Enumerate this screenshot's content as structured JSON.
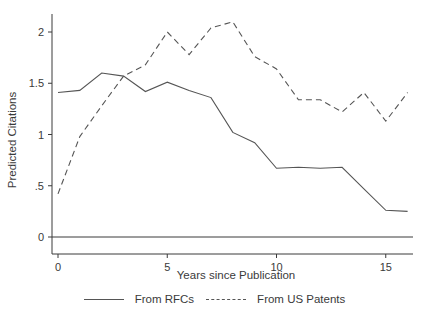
{
  "chart_data": {
    "type": "line",
    "title": "",
    "xlabel": "Years since Publication",
    "ylabel": "Predicted Citations",
    "x": [
      0,
      1,
      2,
      3,
      4,
      5,
      6,
      7,
      8,
      9,
      10,
      11,
      12,
      13,
      14,
      15,
      16
    ],
    "xticks": [
      0,
      5,
      10,
      15
    ],
    "xtick_labels": [
      "0",
      "5",
      "10",
      "15"
    ],
    "yticks": [
      0,
      0.5,
      1,
      1.5,
      2
    ],
    "ytick_labels": [
      "0",
      ".5",
      "1",
      "1.5",
      "2"
    ],
    "xlim": [
      -0.3,
      16.5
    ],
    "ylim": [
      -0.05,
      2.2
    ],
    "grid": false,
    "reference_line_y": 0,
    "legend_position": "bottom",
    "series": [
      {
        "name": "From RFCs",
        "style": "solid",
        "values": [
          1.41,
          1.43,
          1.6,
          1.57,
          1.42,
          1.51,
          1.43,
          1.36,
          1.02,
          0.92,
          0.67,
          0.68,
          0.67,
          0.68,
          0.47,
          0.26,
          0.25
        ]
      },
      {
        "name": "From US Patents",
        "style": "dashed",
        "values": [
          0.42,
          0.98,
          1.28,
          1.57,
          1.68,
          2.0,
          1.78,
          2.04,
          2.1,
          1.76,
          1.64,
          1.34,
          1.34,
          1.22,
          1.41,
          1.13,
          1.41
        ]
      }
    ]
  },
  "legend": {
    "items": [
      {
        "label": "From RFCs",
        "style": "solid"
      },
      {
        "label": "From US Patents",
        "style": "dashed"
      }
    ]
  }
}
